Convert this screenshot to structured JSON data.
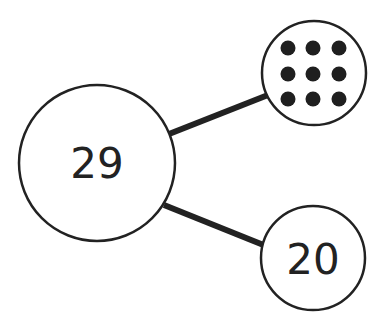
{
  "diagram": {
    "type": "number-bond",
    "whole": {
      "label": "29",
      "value": 29
    },
    "parts": [
      {
        "kind": "dots",
        "count": 9,
        "arrangement": "3x3",
        "label": ""
      },
      {
        "kind": "number",
        "label": "20",
        "value": 20
      }
    ],
    "colors": {
      "stroke": "#222222",
      "fill": "#ffffff",
      "dot": "#1f1f1f"
    }
  }
}
